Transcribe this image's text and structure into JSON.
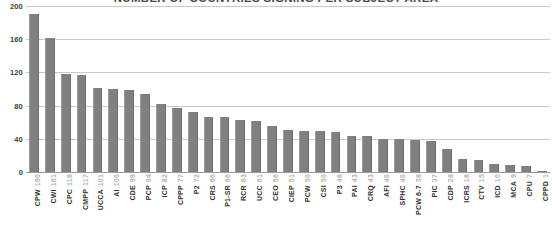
{
  "chart_data": {
    "type": "bar",
    "title": "NUMBER OF COUNTRIES SIGNING PER SUBJECT AREA",
    "xlabel": "",
    "ylabel": "",
    "ylim": [
      0,
      200
    ],
    "yticks": [
      0,
      40,
      80,
      120,
      160,
      200
    ],
    "grid": true,
    "legend": "none",
    "bar_color": "#808080",
    "categories": [
      "CPW",
      "CWI",
      "CPC",
      "CMPP",
      "UCCA",
      "AI",
      "CDE",
      "PCP",
      "ICP",
      "CPPP",
      "P2",
      "CRS",
      "P1-SR",
      "RCR",
      "UCC",
      "CEO",
      "CIEP",
      "PCW",
      "CSI",
      "P3",
      "PAI",
      "CRQ",
      "AFI",
      "SPHC",
      "PCW 6-7",
      "PIC",
      "CDP",
      "ICRS",
      "CTV",
      "ICD",
      "MCA",
      "CPU",
      "CPPD"
    ],
    "values": [
      190,
      161,
      118,
      117,
      101,
      100,
      99,
      94,
      82,
      77,
      72,
      66,
      66,
      63,
      61,
      56,
      51,
      50,
      50,
      48,
      43,
      43,
      40,
      40,
      38,
      37,
      28,
      16,
      15,
      10,
      9,
      7,
      1
    ]
  }
}
